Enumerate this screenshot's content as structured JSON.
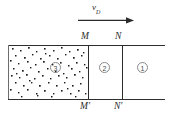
{
  "figure": {
    "background_color": "#ffffff",
    "line_color": "#2e2e2e",
    "speck_color": "#1c1c1c",
    "circle_label_color": "#8a8a8a"
  },
  "velocity": {
    "symbol": "v",
    "subscript": "D",
    "arrow_direction": "right",
    "arrow_icon": "arrow-right-icon"
  },
  "points": {
    "top_left": "M",
    "top_right": "N",
    "bottom_left": "M′",
    "bottom_right": "N′"
  },
  "regions": [
    {
      "id": "region-3",
      "label": "3",
      "circled": true
    },
    {
      "id": "region-2",
      "label": "2",
      "circled": true
    },
    {
      "id": "region-1",
      "label": "1",
      "circled": true
    }
  ]
}
